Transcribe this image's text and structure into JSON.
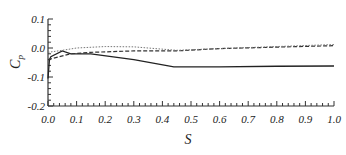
{
  "chart_data": {
    "type": "line",
    "title": "",
    "xlabel": "S",
    "ylabel": "C_p",
    "xlim": [
      0.0,
      1.0
    ],
    "ylim": [
      -0.2,
      0.1
    ],
    "xticks": [
      "0.0",
      "0.1",
      "0.2",
      "0.3",
      "0.4",
      "0.5",
      "0.6",
      "0.7",
      "0.8",
      "0.9",
      "1.0"
    ],
    "yticks": [
      "0.1",
      "0.0",
      "-0.1",
      "-0.2"
    ],
    "grid": false,
    "legend": null,
    "series": [
      {
        "name": "solid",
        "style": "solid",
        "x": [
          0.0,
          0.005,
          0.01,
          0.05,
          0.08,
          0.15,
          0.3,
          0.44,
          0.6,
          0.8,
          1.0
        ],
        "y": [
          -0.105,
          -0.04,
          -0.03,
          -0.01,
          -0.02,
          -0.02,
          -0.04,
          -0.065,
          -0.065,
          -0.063,
          -0.062
        ]
      },
      {
        "name": "dashed",
        "style": "dashed",
        "x": [
          0.0,
          0.02,
          0.08,
          0.15,
          0.3,
          0.45,
          0.6,
          0.8,
          1.0
        ],
        "y": [
          -0.04,
          -0.035,
          -0.02,
          -0.015,
          -0.01,
          -0.01,
          -0.002,
          0.003,
          0.008
        ]
      },
      {
        "name": "dotted",
        "style": "dotted",
        "x": [
          0.0,
          0.05,
          0.1,
          0.2,
          0.3,
          0.45,
          0.6,
          0.8,
          1.0
        ],
        "y": [
          -0.015,
          -0.008,
          0.0,
          0.005,
          0.004,
          -0.008,
          -0.002,
          0.005,
          0.012
        ]
      }
    ]
  }
}
